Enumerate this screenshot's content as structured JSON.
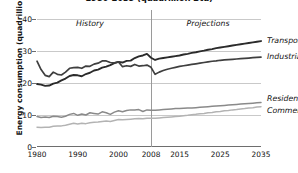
{
  "title": "1980-2035 (quadrillion Btu)",
  "ylabel": "Energy consumption (quadrillion Btu)",
  "eras": {
    "history": "History",
    "projections": "Projections"
  },
  "labels": {
    "transportation": "Transportation",
    "industrial": "Industrial",
    "residential": "Residential",
    "commercial": "Commercial"
  },
  "ticks": {
    "y": [
      "0",
      "10",
      "20",
      "30",
      "40"
    ],
    "x": [
      "1980",
      "1990",
      "2000",
      "2008",
      "2015",
      "2025",
      "2035"
    ]
  },
  "colors": {
    "transportation": "#2b2b2b",
    "industrial": "#3f3f3f",
    "residential": "#8a8a8a",
    "commercial": "#b3b3b3",
    "grid": "#c9c9c9",
    "axis": "#6e6e6e",
    "divider": "#9a9a9a"
  },
  "chart_data": {
    "type": "line",
    "title": "1980-2035 (quadrillion Btu)",
    "xlabel": "",
    "ylabel": "Energy consumption (quadrillion Btu)",
    "xlim": [
      1980,
      2035
    ],
    "ylim": [
      0,
      40
    ],
    "yticks": [
      0,
      10,
      20,
      30,
      40
    ],
    "xticks": [
      1980,
      1990,
      2000,
      2008,
      2015,
      2025,
      2035
    ],
    "grid": true,
    "legend": "right-inline-labels",
    "annotations": [
      {
        "text": "History",
        "x": 1993,
        "y": 38
      },
      {
        "text": "Projections",
        "x": 2022,
        "y": 38
      },
      {
        "text": "divider",
        "x": 2008
      }
    ],
    "history_end": 2008,
    "series": [
      {
        "name": "Transportation",
        "color": "#2b2b2b",
        "x": [
          1980,
          1981,
          1982,
          1983,
          1984,
          1985,
          1986,
          1987,
          1988,
          1989,
          1990,
          1991,
          1992,
          1993,
          1994,
          1995,
          1996,
          1997,
          1998,
          1999,
          2000,
          2001,
          2002,
          2003,
          2004,
          2005,
          2006,
          2007,
          2008,
          2009,
          2010,
          2011,
          2012,
          2013,
          2014,
          2015,
          2016,
          2017,
          2018,
          2019,
          2020,
          2021,
          2022,
          2023,
          2024,
          2025,
          2026,
          2027,
          2028,
          2029,
          2030,
          2031,
          2032,
          2033,
          2034,
          2035
        ],
        "values": [
          19.7,
          19.5,
          19.1,
          19.2,
          19.8,
          20.1,
          20.8,
          21.4,
          22.2,
          22.5,
          22.4,
          22.1,
          22.8,
          23.2,
          23.9,
          24.2,
          24.8,
          25.1,
          25.6,
          26.2,
          26.6,
          26.4,
          26.9,
          27.0,
          27.8,
          28.3,
          28.6,
          29.1,
          27.9,
          27.2,
          27.6,
          27.8,
          28.0,
          28.2,
          28.4,
          28.6,
          28.9,
          29.1,
          29.4,
          29.6,
          29.9,
          30.1,
          30.4,
          30.6,
          30.9,
          31.1,
          31.3,
          31.5,
          31.7,
          31.9,
          32.1,
          32.3,
          32.5,
          32.7,
          32.9,
          33.1
        ]
      },
      {
        "name": "Industrial",
        "color": "#3f3f3f",
        "x": [
          1980,
          1981,
          1982,
          1983,
          1984,
          1985,
          1986,
          1987,
          1988,
          1989,
          1990,
          1991,
          1992,
          1993,
          1994,
          1995,
          1996,
          1997,
          1998,
          1999,
          2000,
          2001,
          2002,
          2003,
          2004,
          2005,
          2006,
          2007,
          2008,
          2009,
          2010,
          2011,
          2012,
          2013,
          2014,
          2015,
          2016,
          2017,
          2018,
          2019,
          2020,
          2021,
          2022,
          2023,
          2024,
          2025,
          2026,
          2027,
          2028,
          2029,
          2030,
          2031,
          2032,
          2033,
          2034,
          2035
        ],
        "values": [
          26.8,
          24.2,
          22.4,
          22.0,
          23.4,
          22.7,
          22.5,
          23.4,
          24.6,
          24.8,
          24.9,
          24.6,
          25.3,
          25.2,
          25.9,
          26.2,
          26.9,
          26.9,
          26.4,
          26.3,
          26.6,
          25.1,
          25.4,
          25.2,
          25.8,
          25.3,
          25.4,
          25.6,
          24.9,
          22.7,
          23.4,
          23.9,
          24.3,
          24.6,
          24.9,
          25.2,
          25.4,
          25.6,
          25.8,
          26.0,
          26.2,
          26.4,
          26.6,
          26.8,
          26.9,
          27.1,
          27.2,
          27.3,
          27.4,
          27.5,
          27.6,
          27.7,
          27.8,
          27.9,
          28.0,
          28.1
        ]
      },
      {
        "name": "Residential",
        "color": "#8a8a8a",
        "x": [
          1980,
          1981,
          1982,
          1983,
          1984,
          1985,
          1986,
          1987,
          1988,
          1989,
          1990,
          1991,
          1992,
          1993,
          1994,
          1995,
          1996,
          1997,
          1998,
          1999,
          2000,
          2001,
          2002,
          2003,
          2004,
          2005,
          2006,
          2007,
          2008,
          2009,
          2010,
          2011,
          2012,
          2013,
          2014,
          2015,
          2016,
          2017,
          2018,
          2019,
          2020,
          2021,
          2022,
          2023,
          2024,
          2025,
          2026,
          2027,
          2028,
          2029,
          2030,
          2031,
          2032,
          2033,
          2034,
          2035
        ],
        "values": [
          9.5,
          9.2,
          9.4,
          9.2,
          9.6,
          9.5,
          9.3,
          9.6,
          10.2,
          10.5,
          9.9,
          10.3,
          10.0,
          10.7,
          10.5,
          10.3,
          11.0,
          10.7,
          10.2,
          10.9,
          11.3,
          11.0,
          11.4,
          11.6,
          11.6,
          11.7,
          11.1,
          11.6,
          11.5,
          11.5,
          11.6,
          11.7,
          11.8,
          11.9,
          12.0,
          12.0,
          12.1,
          12.2,
          12.2,
          12.3,
          12.4,
          12.5,
          12.6,
          12.7,
          12.8,
          12.9,
          13.0,
          13.1,
          13.2,
          13.3,
          13.4,
          13.5,
          13.6,
          13.7,
          13.8,
          13.9
        ]
      },
      {
        "name": "Commercial",
        "color": "#b3b3b3",
        "x": [
          1980,
          1981,
          1982,
          1983,
          1984,
          1985,
          1986,
          1987,
          1988,
          1989,
          1990,
          1991,
          1992,
          1993,
          1994,
          1995,
          1996,
          1997,
          1998,
          1999,
          2000,
          2001,
          2002,
          2003,
          2004,
          2005,
          2006,
          2007,
          2008,
          2009,
          2010,
          2011,
          2012,
          2013,
          2014,
          2015,
          2016,
          2017,
          2018,
          2019,
          2020,
          2021,
          2022,
          2023,
          2024,
          2025,
          2026,
          2027,
          2028,
          2029,
          2030,
          2031,
          2032,
          2033,
          2034,
          2035
        ],
        "values": [
          6.2,
          6.1,
          6.2,
          6.2,
          6.5,
          6.6,
          6.6,
          6.8,
          7.1,
          7.4,
          7.2,
          7.4,
          7.3,
          7.6,
          7.7,
          7.8,
          8.0,
          8.1,
          8.0,
          8.3,
          8.6,
          8.5,
          8.6,
          8.7,
          8.8,
          8.9,
          8.8,
          9.0,
          9.0,
          9.0,
          9.1,
          9.2,
          9.3,
          9.4,
          9.5,
          9.6,
          9.8,
          9.9,
          10.1,
          10.2,
          10.4,
          10.5,
          10.7,
          10.8,
          11.0,
          11.1,
          11.3,
          11.4,
          11.6,
          11.7,
          11.9,
          12.0,
          12.2,
          12.3,
          12.5,
          12.6
        ]
      }
    ]
  }
}
